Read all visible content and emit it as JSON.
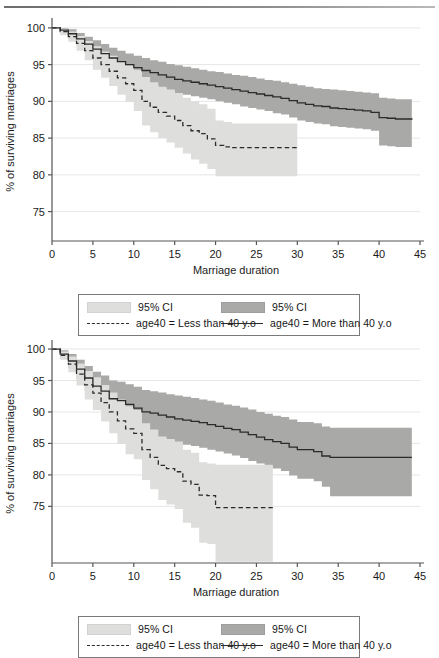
{
  "figure": {
    "width": 439,
    "height": 648,
    "top_rule": true
  },
  "colors": {
    "ci_light": "#dededc",
    "ci_dark": "#a9a9a7",
    "line": "#2b2b2b",
    "axis": "#555555",
    "grid": "#e6e6e6",
    "legend_border": "#7a7a7a",
    "background": "#ffffff"
  },
  "legend": {
    "ci_light_label": "95% CI",
    "ci_dark_label": "95% CI",
    "line_dashed_label": "age40 = Less than 40 y.o",
    "line_solid_label": "age40 = More than 40 y.o"
  },
  "chart_data": [
    {
      "id": "chart-top",
      "type": "line",
      "title": "",
      "xlabel": "Marriage duration",
      "ylabel": "% of surviving marriages",
      "xlim": [
        0,
        45
      ],
      "ylim": [
        71,
        100.8
      ],
      "xticks": [
        0,
        5,
        10,
        15,
        20,
        25,
        30,
        35,
        40,
        45
      ],
      "xticklabels": [
        "0",
        "5",
        "10",
        "15",
        "20",
        "25",
        "30",
        "35",
        "40",
        "45"
      ],
      "yticks": [
        75,
        80,
        85,
        90,
        95,
        100
      ],
      "yticklabels": [
        "75",
        "80",
        "85",
        "90",
        "95",
        "100"
      ],
      "grid": "horizontal",
      "legend_position": "below",
      "series": [
        {
          "name": "age40 = More than 40 y.o",
          "style": "solid",
          "color": "#2b2b2b",
          "x": [
            0,
            1,
            2,
            3,
            4,
            5,
            6,
            7,
            8,
            9,
            10,
            11,
            12,
            13,
            14,
            15,
            16,
            17,
            18,
            19,
            20,
            21,
            22,
            23,
            24,
            25,
            26,
            27,
            28,
            29,
            30,
            31,
            32,
            33,
            34,
            35,
            36,
            37,
            38,
            39,
            40,
            41,
            42,
            43,
            44
          ],
          "y": [
            100.0,
            99.7,
            99.2,
            98.5,
            97.8,
            97.1,
            96.5,
            95.9,
            95.4,
            95.0,
            94.6,
            94.2,
            93.9,
            93.6,
            93.3,
            93.0,
            92.8,
            92.6,
            92.4,
            92.2,
            92.0,
            91.8,
            91.6,
            91.4,
            91.2,
            91.0,
            90.8,
            90.6,
            90.4,
            90.1,
            89.8,
            89.6,
            89.4,
            89.3,
            89.1,
            89.0,
            88.9,
            88.8,
            88.7,
            88.5,
            87.8,
            87.7,
            87.6,
            87.6,
            87.5
          ],
          "ci_upper": [
            100.0,
            100.0,
            99.8,
            99.3,
            98.8,
            98.3,
            97.8,
            97.3,
            96.9,
            96.5,
            96.2,
            95.9,
            95.6,
            95.4,
            95.1,
            94.9,
            94.7,
            94.5,
            94.3,
            94.1,
            94.0,
            93.8,
            93.6,
            93.5,
            93.3,
            93.1,
            92.9,
            92.8,
            92.6,
            92.4,
            92.2,
            92.0,
            91.8,
            91.7,
            91.6,
            91.5,
            91.4,
            91.3,
            91.2,
            91.1,
            90.5,
            90.4,
            90.3,
            90.3,
            90.3
          ],
          "ci_lower": [
            100.0,
            99.4,
            98.6,
            97.7,
            96.8,
            95.9,
            95.2,
            94.5,
            93.9,
            93.5,
            93.0,
            92.5,
            92.2,
            91.8,
            91.5,
            91.1,
            90.9,
            90.7,
            90.5,
            90.3,
            90.0,
            89.8,
            89.6,
            89.3,
            89.1,
            88.9,
            88.7,
            88.4,
            88.2,
            87.8,
            87.4,
            87.2,
            87.0,
            86.9,
            86.6,
            86.5,
            86.4,
            86.3,
            86.2,
            86.0,
            84.0,
            83.9,
            83.8,
            83.8,
            82.0
          ],
          "ci_fill": "#a9a9a7"
        },
        {
          "name": "age40 = Less than 40 y.o",
          "style": "dashed",
          "color": "#2b2b2b",
          "x": [
            0,
            1,
            2,
            3,
            4,
            5,
            6,
            7,
            8,
            9,
            10,
            11,
            12,
            13,
            14,
            15,
            16,
            17,
            18,
            19,
            20,
            21,
            22,
            23,
            24,
            25,
            26,
            27,
            28,
            29,
            30
          ],
          "y": [
            100.0,
            99.5,
            98.8,
            97.9,
            96.9,
            95.9,
            95.0,
            94.1,
            93.2,
            92.4,
            91.5,
            90.0,
            89.2,
            88.5,
            88.0,
            87.4,
            86.7,
            86.0,
            85.6,
            84.9,
            84.0,
            83.8,
            83.7,
            83.7,
            83.7,
            83.7,
            83.7,
            83.7,
            83.7,
            83.7,
            83.7
          ],
          "ci_upper": [
            100.0,
            99.9,
            99.5,
            98.9,
            98.2,
            97.5,
            96.8,
            96.2,
            95.5,
            94.9,
            94.3,
            93.3,
            92.6,
            92.0,
            91.6,
            91.1,
            90.5,
            90.0,
            89.6,
            89.0,
            87.4,
            87.2,
            87.0,
            87.0,
            87.0,
            87.0,
            87.0,
            87.0,
            87.0,
            87.0,
            87.0
          ],
          "ci_lower": [
            100.0,
            99.0,
            98.1,
            96.9,
            95.6,
            94.3,
            93.2,
            92.1,
            90.9,
            89.9,
            88.7,
            86.7,
            85.8,
            85.0,
            84.4,
            83.7,
            82.9,
            82.1,
            81.5,
            80.8,
            79.8,
            79.8,
            79.8,
            79.8,
            79.8,
            79.8,
            79.8,
            79.8,
            79.8,
            79.8,
            79.8
          ],
          "ci_fill": "#dededc"
        }
      ]
    },
    {
      "id": "chart-bottom",
      "type": "line",
      "title": "",
      "xlabel": "Marriage duration",
      "ylabel": "% of surviving marriages",
      "xlim": [
        0,
        45
      ],
      "ylim": [
        66,
        100.8
      ],
      "xticks": [
        0,
        5,
        10,
        15,
        20,
        25,
        30,
        35,
        40,
        45
      ],
      "xticklabels": [
        "0",
        "5",
        "10",
        "15",
        "20",
        "25",
        "30",
        "35",
        "40",
        "45"
      ],
      "yticks": [
        75,
        80,
        85,
        90,
        95,
        100
      ],
      "yticklabels": [
        "75",
        "80",
        "85",
        "90",
        "95",
        "100"
      ],
      "grid": "horizontal",
      "legend_position": "below",
      "series": [
        {
          "name": "age40 = More than 40 y.o",
          "style": "solid",
          "color": "#2b2b2b",
          "x": [
            0,
            1,
            2,
            3,
            4,
            5,
            6,
            7,
            8,
            9,
            10,
            11,
            12,
            13,
            14,
            15,
            16,
            17,
            18,
            19,
            20,
            21,
            22,
            23,
            24,
            25,
            26,
            27,
            28,
            29,
            30,
            31,
            32,
            33,
            34,
            35,
            36,
            37,
            38,
            39,
            40,
            41,
            42,
            43,
            44
          ],
          "y": [
            100.0,
            99.2,
            98.1,
            96.8,
            95.4,
            94.1,
            93.3,
            92.1,
            91.8,
            91.2,
            90.6,
            90.0,
            89.8,
            89.5,
            89.2,
            88.9,
            88.7,
            88.5,
            88.3,
            88.0,
            87.7,
            87.4,
            87.2,
            86.8,
            86.4,
            86.0,
            85.6,
            85.3,
            85.0,
            84.4,
            84.0,
            84.0,
            83.7,
            83.0,
            82.8,
            82.8,
            82.8,
            82.8,
            82.8,
            82.8,
            82.8,
            82.8,
            82.8,
            82.8,
            82.8
          ],
          "ci_upper": [
            100.0,
            99.8,
            99.2,
            98.3,
            97.3,
            96.4,
            95.8,
            95.0,
            94.8,
            94.4,
            94.0,
            93.5,
            93.3,
            93.1,
            92.8,
            92.6,
            92.4,
            92.2,
            92.0,
            91.8,
            91.5,
            91.2,
            91.0,
            90.7,
            90.4,
            90.0,
            89.7,
            89.4,
            89.2,
            88.8,
            88.4,
            88.4,
            88.2,
            87.7,
            87.5,
            87.5,
            87.5,
            87.5,
            87.5,
            87.5,
            87.5,
            87.5,
            87.5,
            87.5,
            87.5
          ],
          "ci_lower": [
            100.0,
            98.5,
            96.9,
            95.2,
            93.4,
            91.7,
            90.7,
            89.2,
            88.7,
            88.0,
            87.2,
            86.5,
            86.2,
            85.8,
            85.5,
            85.1,
            84.8,
            84.6,
            84.3,
            84.0,
            83.7,
            83.4,
            83.1,
            82.7,
            82.2,
            81.8,
            81.3,
            81.0,
            80.6,
            79.9,
            79.4,
            79.4,
            79.0,
            78.1,
            76.6,
            76.6,
            76.6,
            76.6,
            76.6,
            76.6,
            76.6,
            76.6,
            76.6,
            76.6,
            76.6
          ],
          "ci_fill": "#a9a9a7"
        },
        {
          "name": "age40 = Less than 40 y.o",
          "style": "dashed",
          "color": "#2b2b2b",
          "x": [
            0,
            1,
            2,
            3,
            4,
            5,
            6,
            7,
            8,
            9,
            10,
            11,
            12,
            13,
            14,
            15,
            16,
            17,
            18,
            19,
            20,
            21,
            22,
            23,
            24,
            25,
            26,
            27
          ],
          "y": [
            100.0,
            99.0,
            97.6,
            96.0,
            94.3,
            93.0,
            91.5,
            90.0,
            88.6,
            87.3,
            86.6,
            84.0,
            82.8,
            81.5,
            81.0,
            80.5,
            79.0,
            78.5,
            76.8,
            76.7,
            74.8,
            74.8,
            74.8,
            74.8,
            74.8,
            74.8,
            74.8,
            74.8
          ],
          "ci_upper": [
            100.0,
            99.6,
            98.8,
            97.7,
            96.5,
            95.5,
            94.3,
            93.1,
            92.0,
            90.9,
            90.3,
            88.2,
            87.2,
            86.1,
            85.7,
            85.3,
            84.0,
            83.5,
            82.0,
            81.8,
            81.6,
            81.6,
            81.6,
            81.6,
            81.6,
            81.6,
            81.6,
            81.6
          ],
          "ci_lower": [
            100.0,
            98.3,
            96.3,
            94.2,
            92.0,
            90.3,
            88.5,
            86.6,
            84.9,
            83.3,
            82.5,
            79.2,
            77.7,
            76.0,
            75.3,
            74.6,
            72.4,
            71.6,
            69.2,
            69.0,
            66.2,
            66.2,
            66.2,
            66.2,
            66.2,
            66.2,
            66.2,
            66.2
          ],
          "ci_fill": "#dededc"
        }
      ]
    }
  ]
}
